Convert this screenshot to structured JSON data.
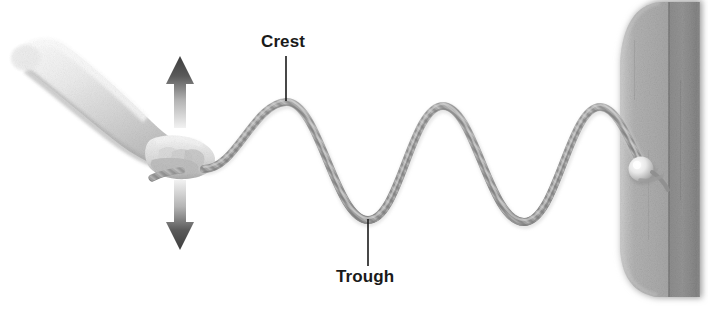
{
  "figure": {
    "background_color": "#ffffff",
    "width": 708,
    "height": 318
  },
  "labels": {
    "crest": "Crest",
    "trough": "Trough"
  },
  "annotations": {
    "crest_leader": {
      "x": 286,
      "y_top": 56,
      "y_bottom": 101,
      "color": "#1a1a1a"
    },
    "trough_leader": {
      "x": 368,
      "y_top": 219,
      "y_bottom": 266,
      "color": "#1a1a1a"
    }
  },
  "elements": {
    "arm": {
      "name": "arm-holding-rope",
      "description": "Shaded human forearm and hand gripping the end of the rope"
    },
    "hand": {
      "name": "hand-grip",
      "description": "Hand gripping rope end"
    },
    "rope": {
      "name": "rope-wave",
      "description": "Braided rope forming a transverse wave with three crests and two troughs",
      "color": "#9a9a9a"
    },
    "up_arrow": {
      "name": "up-arrow",
      "description": "Gradient arrow pointing up showing hand motion",
      "color": "#4d4d4d"
    },
    "down_arrow": {
      "name": "down-arrow",
      "description": "Gradient arrow pointing down showing hand motion",
      "color": "#4d4d4d"
    },
    "door": {
      "name": "door-panel",
      "description": "Gray door panel at right edge with rounded corner",
      "color": "#9e9e9e"
    },
    "knob": {
      "name": "doorknob",
      "description": "Round knob the rope is tied to",
      "color": "#e6e6e6"
    }
  },
  "wave_geometry": {
    "start": {
      "x": 212,
      "y": 168
    },
    "crests": [
      {
        "x": 286,
        "y": 101
      },
      {
        "x": 443,
        "y": 105
      },
      {
        "x": 600,
        "y": 106
      }
    ],
    "troughs": [
      {
        "x": 368,
        "y": 219
      },
      {
        "x": 525,
        "y": 221
      }
    ],
    "end": {
      "x": 641,
      "y": 168
    }
  }
}
